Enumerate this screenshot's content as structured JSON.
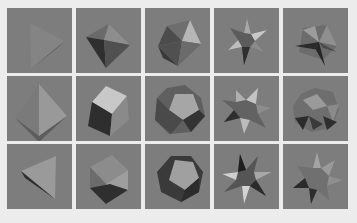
{
  "grid": {
    "rows": 3,
    "columns": 5,
    "background": "#ececec",
    "tile_background": "#7d7d7d",
    "tiles": [
      {
        "row": 0,
        "col": 0,
        "shape": "tetrahedron"
      },
      {
        "row": 0,
        "col": 1,
        "shape": "octahedron"
      },
      {
        "row": 0,
        "col": 2,
        "shape": "icosahedron"
      },
      {
        "row": 0,
        "col": 3,
        "shape": "small-stellated-dodecahedron"
      },
      {
        "row": 0,
        "col": 4,
        "shape": "great-dodecahedron"
      },
      {
        "row": 1,
        "col": 0,
        "shape": "tetrahedron"
      },
      {
        "row": 1,
        "col": 1,
        "shape": "cube"
      },
      {
        "row": 1,
        "col": 2,
        "shape": "dodecahedron"
      },
      {
        "row": 1,
        "col": 3,
        "shape": "great-stellated-dodecahedron"
      },
      {
        "row": 1,
        "col": 4,
        "shape": "great-icosahedron"
      },
      {
        "row": 2,
        "col": 0,
        "shape": "tetrahedron"
      },
      {
        "row": 2,
        "col": 1,
        "shape": "cube"
      },
      {
        "row": 2,
        "col": 2,
        "shape": "dodecahedron"
      },
      {
        "row": 2,
        "col": 3,
        "shape": "small-stellated-dodecahedron"
      },
      {
        "row": 2,
        "col": 4,
        "shape": "great-stellated-dodecahedron"
      }
    ]
  }
}
